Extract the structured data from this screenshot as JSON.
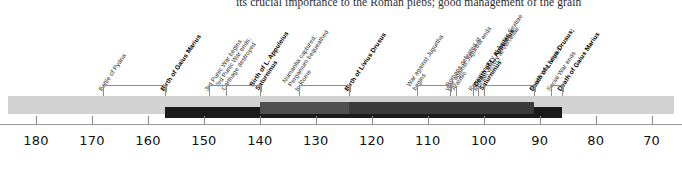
{
  "page": {
    "bleed_text": "its crucial importance to the Roman plebs; good management of the grain"
  },
  "chart_data": {
    "type": "timeline",
    "title": "",
    "xlabel": "",
    "ylabel": "",
    "xlim": [
      185,
      66
    ],
    "axis_direction": "descending-BC",
    "grid": false,
    "legend": "none",
    "tick_labels": [
      "180",
      "170",
      "160",
      "150",
      "140",
      "130",
      "120",
      "110",
      "100",
      "90",
      "80",
      "70"
    ],
    "tick_values": [
      180,
      170,
      160,
      150,
      140,
      130,
      120,
      110,
      100,
      90,
      80,
      70
    ],
    "events": [
      {
        "label": "Battle of Pydna",
        "year": 168,
        "bold": false,
        "lines": [
          "Battle of Pydna"
        ]
      },
      {
        "label": "Birth of Gaius Marius",
        "year": 157,
        "bold": true,
        "lines": [
          "Birth of Gaius Marius"
        ]
      },
      {
        "label": "3rd Punic War begins",
        "year": 149,
        "bold": false,
        "lines": [
          "3rd Punic War begins"
        ]
      },
      {
        "label": "3rd Punic War ends; Carthage destroyed",
        "year": 146,
        "bold": false,
        "lines": [
          "3rd Punic War ends;",
          "Carthage destroyed"
        ]
      },
      {
        "label": "Birth of L. Appuleius Saturninus",
        "year": 140,
        "bold": true,
        "lines": [
          "Birth of L. Appuleius",
          "Saturninus"
        ]
      },
      {
        "label": "Numantia captured; Pergamum bequeathed to Rome",
        "year": 133,
        "bold": false,
        "lines": [
          "Numantia captured;",
          "Pergamum bequeathed",
          "to Rome"
        ]
      },
      {
        "label": "Birth of Livius Drusus",
        "year": 124,
        "bold": true,
        "lines": [
          "Birth of Livius Drusus"
        ]
      },
      {
        "label": "War against Jugurtha begins",
        "year": 112,
        "bold": false,
        "lines": [
          "War against Jugurtha",
          "begins"
        ]
      },
      {
        "label": "War against Jugurtha ends",
        "year": 106,
        "bold": false,
        "lines": [
          "War against Jugurtha ends"
        ]
      },
      {
        "label": "Romans defeated at Arausio",
        "year": 105,
        "bold": false,
        "lines": [
          "Romans defeated at",
          "Arausio"
        ]
      },
      {
        "label": "Roman victory at Aquae Sextiae",
        "year": 102,
        "bold": false,
        "lines": [
          "Roman victory at Aquae Sextiae"
        ]
      },
      {
        "label": "Roman victory at Vercellae",
        "year": 101,
        "bold": false,
        "lines": [
          "Roman victory at Vercellae"
        ]
      },
      {
        "label": "Death of L. Appuleius Saturninus",
        "year": 100,
        "bold": true,
        "lines": [
          "Death of L. Appuleius",
          "Saturninus"
        ]
      },
      {
        "label": "Death of Livius Drusus; Social War begins",
        "year": 91,
        "bold": true,
        "lines": [
          "Death of Livius Drusus;"
        ]
      },
      {
        "label": "Social War begins",
        "year": 91,
        "bold": false,
        "lines": [
          "Social War begins"
        ]
      },
      {
        "label": "Social War ends",
        "year": 88,
        "bold": false,
        "lines": [
          "Social War ends"
        ]
      },
      {
        "label": "Death of Gaius Marius",
        "year": 86,
        "bold": true,
        "lines": [
          "Death of Gaius Marius"
        ]
      }
    ],
    "life_bars": [
      {
        "name": "background-span",
        "start": 185,
        "end": 66,
        "color": "#d2d2d2",
        "row": 0
      },
      {
        "name": "gaius-marius-life",
        "start": 157,
        "end": 86,
        "color": "#1b1b1b",
        "row": 2
      },
      {
        "name": "appuleius-saturninus-life",
        "start": 140,
        "end": 100,
        "color": "#4f4f4f",
        "row": 1
      },
      {
        "name": "livius-drusus-life",
        "start": 124,
        "end": 91,
        "color": "#3a3a3a",
        "row": 1
      }
    ],
    "colors": {
      "band_background": "#d2d2d2",
      "bar_dark": "#1b1b1b",
      "bar_mid": "#4f4f4f",
      "bar_grey": "#3a3a3a",
      "axis": "#9a9a9a",
      "text": "#1a1a1a"
    }
  }
}
